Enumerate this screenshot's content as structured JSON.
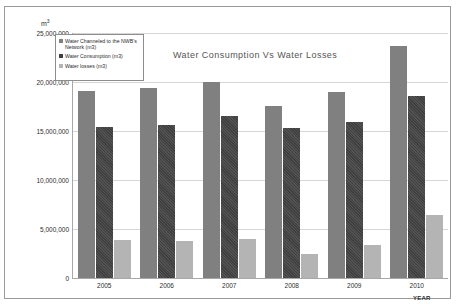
{
  "unit_label": "m",
  "unit_superscript": "3",
  "x_axis_title": "YEAR",
  "chart_data": {
    "type": "bar",
    "title": "Water Consumption Vs Water Losses",
    "xlabel": "YEAR",
    "ylabel": "m3",
    "ylim": [
      0,
      25000000
    ],
    "grid": true,
    "legend_position": "top-left",
    "categories": [
      "2005",
      "2006",
      "2007",
      "2008",
      "2009",
      "2010"
    ],
    "ytick_labels": [
      "25,000,000",
      "20,000,000",
      "15,000,000",
      "10,000,000",
      "5,000,000",
      "0"
    ],
    "ytick_values": [
      25000000,
      20000000,
      15000000,
      10000000,
      5000000,
      0
    ],
    "series": [
      {
        "name": "Water Channeled  to the NWB's Network (m3)",
        "color": "#808080",
        "values": [
          19100000,
          19400000,
          20000000,
          17600000,
          19000000,
          23700000
        ]
      },
      {
        "name": "Water Consumption (m3)",
        "color": "#3f3f3f",
        "values": [
          15400000,
          15600000,
          16500000,
          15300000,
          15900000,
          18600000
        ]
      },
      {
        "name": "Water losses (m3)",
        "color": "#b4b4b4",
        "values": [
          3900000,
          3800000,
          4000000,
          2500000,
          3400000,
          6400000
        ]
      }
    ]
  }
}
